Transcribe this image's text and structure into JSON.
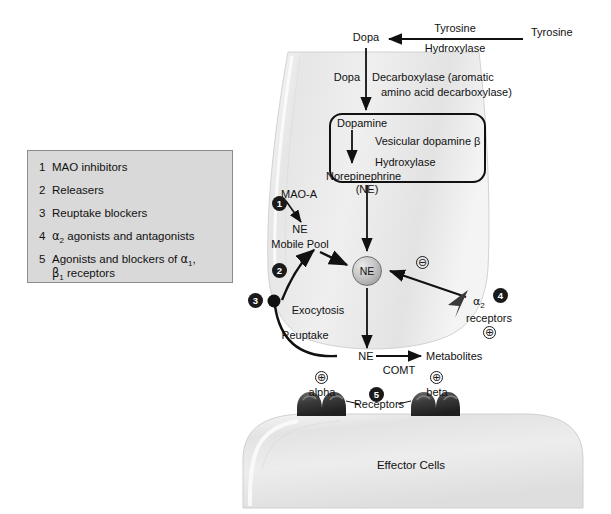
{
  "figure": {
    "background_color": "#ffffff"
  },
  "legend": {
    "background_color": "#d9d9d9",
    "border_color": "#8b8b8b",
    "items": [
      {
        "number": "1",
        "label": "MAO inhibitors"
      },
      {
        "number": "2",
        "label": "Releasers"
      },
      {
        "number": "3",
        "label": "Reuptake blockers"
      },
      {
        "number": "4",
        "label_pre": "",
        "label": "agonists and antagonists",
        "symbol": "α",
        "subscript": "2"
      },
      {
        "number": "5",
        "label": "Agonists and blockers of",
        "symbol": "α",
        "subscript": "1",
        "line2_symbol": "β",
        "line2_subscript": "1",
        "line2_label": "receptors"
      }
    ]
  },
  "synthesis_pathway": {
    "tyrosine_external": "Tyrosine",
    "enzyme_tyrosine_hydroxylase_line1": "Tyrosine",
    "enzyme_tyrosine_hydroxylase_line2": "Hydroxylase",
    "dopa": "Dopa",
    "enzyme_dopa_decarboxylase_word1": "Dopa",
    "enzyme_dopa_decarboxylase_line1": "Decarboxylase (aromatic",
    "enzyme_dopa_decarboxylase_line2": "amino acid decarboxylase)"
  },
  "vesicle": {
    "dopamine": "Dopamine",
    "enzyme_line1": "Vesicular dopamine β",
    "enzyme_line2": "Hydroxylase",
    "norepinephrine": "Norepinephrine",
    "norepinephrine_abbrev": "(NE)"
  },
  "terminal": {
    "mao_a": "MAO-A",
    "ne": "NE",
    "mobile_pool": "Mobile Pool",
    "ne_vesicle_label": "NE",
    "exocytosis": "Exocytosis",
    "reuptake": "Reuptake"
  },
  "autoreceptor": {
    "symbol": "α",
    "subscript": "2",
    "label": "receptors",
    "badge": "4",
    "negative_sign": "⊖",
    "positive_sign": "⊕"
  },
  "synaptic_cleft": {
    "ne": "NE",
    "comt": "COMT",
    "metabolites": "Metabolites"
  },
  "postsynaptic": {
    "alpha_label": "alpha",
    "beta_label": "beta",
    "alpha_sign": "⊕",
    "beta_sign": "⊕",
    "receptors_label": "Receptors",
    "badge": "5",
    "effector_cells": "Effector Cells"
  },
  "badges": {
    "one": "1",
    "two": "2",
    "three": "3",
    "four": "4",
    "five": "5"
  },
  "colors": {
    "terminal_fill": "#ececec",
    "effector_fill": "#e4e4e4",
    "line": "#111111",
    "receptor_dark": "#3d3d3d"
  }
}
